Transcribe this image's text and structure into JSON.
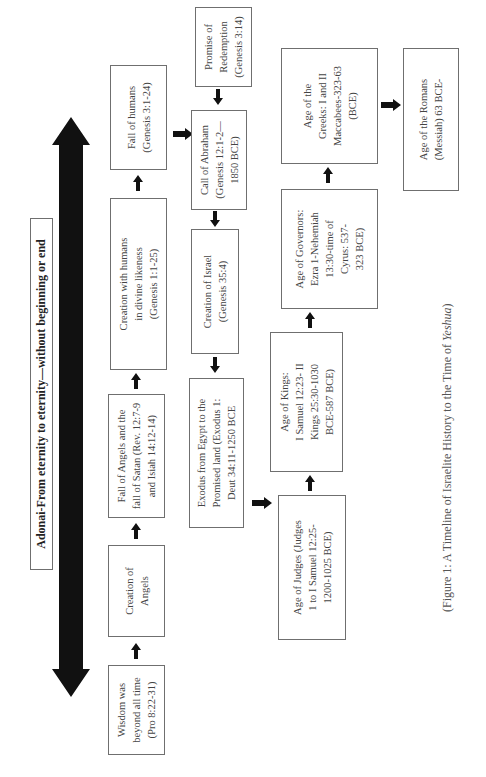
{
  "header": {
    "title": "Adonai-From eternity to eternity—without beginning or end"
  },
  "row1": [
    {
      "id": "wisdom",
      "lines": [
        "Wisdom was",
        "beyond all time",
        "(Pro 8:22-31)"
      ]
    },
    {
      "id": "creation-angels",
      "lines": [
        "Creation of",
        "Angels"
      ]
    },
    {
      "id": "fall-angels",
      "lines": [
        "Fall of Angels and the",
        "fall of Satan (Rev. 12:7-9",
        "and Isiah 14:12-14)"
      ]
    },
    {
      "id": "creation-humans",
      "lines": [
        "Creation with humans",
        "in divine likeness",
        "(Genesis 1:1-25)"
      ]
    },
    {
      "id": "fall-humans",
      "lines": [
        "Fall of humans",
        "(Genesis 3:1-24)"
      ]
    }
  ],
  "row2": [
    {
      "id": "exodus",
      "lines": [
        "Exodus from Egypt to the",
        "Promised land (Exodus 1:",
        "Deut 34:11-1250 BCE"
      ]
    },
    {
      "id": "creation-israel",
      "lines": [
        "Creation of Israel",
        "(Genesis 35:4)"
      ]
    },
    {
      "id": "call-abraham",
      "lines": [
        "Call of Abraham",
        "(Genesis 12:1-2—",
        "1850 BCE)"
      ]
    },
    {
      "id": "promise-redemption",
      "lines": [
        "Promise of",
        "Redemption",
        "(Genesis 3:14)"
      ]
    }
  ],
  "row3": [
    {
      "id": "age-judges",
      "lines": [
        "Age of Judges (Judges",
        "1 to I Samuel 12:25-",
        "1200-1025 BCE)"
      ]
    },
    {
      "id": "age-kings",
      "lines": [
        "Age of Kings:",
        "I Samuel 12:23- II",
        "Kings 25:30-1030",
        "BCE-587 BCE)"
      ]
    },
    {
      "id": "age-governors",
      "lines": [
        "Age of Governors:",
        "Ezra 1-Nehemiah",
        "13:30-time of",
        "Cyrus: 537-",
        "323 BCE)"
      ]
    },
    {
      "id": "age-greeks",
      "lines": [
        "Age of the",
        "Greeks: I and II",
        "Maccabees-323-63",
        "(BCE)"
      ]
    }
  ],
  "row4": [
    {
      "id": "age-romans",
      "lines": [
        "Age of the Romans",
        "(Messiah) 63 BCE-"
      ]
    }
  ],
  "caption": {
    "prefix": "(Figure 1: A Timeline of Israelite History to the Time of ",
    "italic": "Yeshua",
    "suffix": ")"
  },
  "colors": {
    "arrow": "#111111",
    "border": "#6f6f6f",
    "text": "#444444"
  }
}
